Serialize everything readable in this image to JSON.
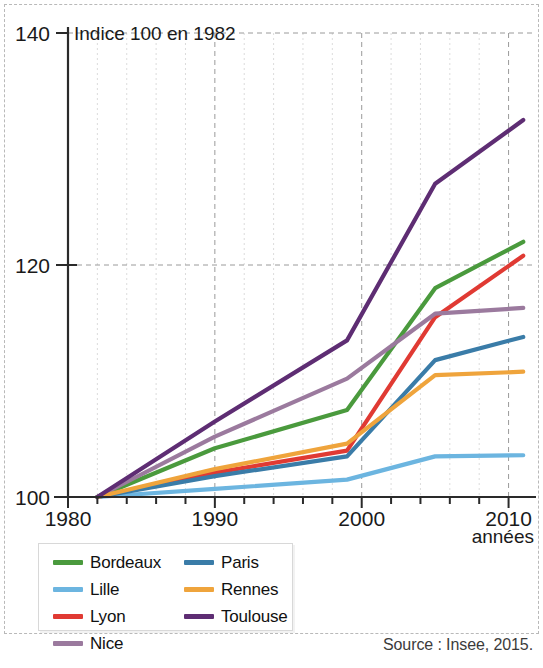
{
  "figure": {
    "plot_note": "Indice 100 en 1982",
    "x_axis_title": "années",
    "source": "Source : Insee, 2015."
  },
  "legend": {
    "items": [
      {
        "label": "Bordeaux",
        "color": "#4a9a3d",
        "column": 1
      },
      {
        "label": "Lille",
        "color": "#6cb5e0",
        "column": 1
      },
      {
        "label": "Lyon",
        "color": "#e03a33",
        "column": 1
      },
      {
        "label": "Nice",
        "color": "#9b7a9e",
        "column": 1
      },
      {
        "label": "Paris",
        "color": "#3a7ca8",
        "column": 2
      },
      {
        "label": "Rennes",
        "color": "#efa43c",
        "column": 2
      },
      {
        "label": "Toulouse",
        "color": "#5e2d73",
        "column": 2
      }
    ]
  },
  "chart_data": {
    "type": "line",
    "title": "",
    "subtitle": "Indice 100 en 1982",
    "xlabel": "années",
    "ylabel": "",
    "xlim": [
      1980,
      2011.8
    ],
    "ylim": [
      100,
      140
    ],
    "x_ticks_major": [
      1980,
      1990,
      2000,
      2010
    ],
    "x_ticks_minor_step": 2,
    "y_ticks": [
      100,
      120,
      140
    ],
    "grid": "dotted vertical every 2 years, dashed major at decades; dashed horizontal at 120 and 140",
    "legend_position": "below-left",
    "x": [
      1982,
      1990,
      1999,
      2005,
      2011
    ],
    "series": [
      {
        "name": "Bordeaux",
        "color": "#4a9a3d",
        "values": [
          100,
          104.2,
          107.5,
          118.0,
          122.0
        ]
      },
      {
        "name": "Lille",
        "color": "#6cb5e0",
        "values": [
          100,
          100.7,
          101.5,
          103.5,
          103.6
        ]
      },
      {
        "name": "Lyon",
        "color": "#e03a33",
        "values": [
          100,
          102.1,
          104.0,
          115.5,
          120.8
        ]
      },
      {
        "name": "Nice",
        "color": "#9b7a9e",
        "values": [
          100,
          105.2,
          110.2,
          115.8,
          116.3
        ]
      },
      {
        "name": "Paris",
        "color": "#3a7ca8",
        "values": [
          100,
          101.8,
          103.5,
          111.8,
          113.8
        ]
      },
      {
        "name": "Rennes",
        "color": "#efa43c",
        "values": [
          100,
          102.4,
          104.6,
          110.5,
          110.8
        ]
      },
      {
        "name": "Toulouse",
        "color": "#5e2d73",
        "values": [
          100,
          106.5,
          113.5,
          127.0,
          132.5
        ]
      }
    ]
  }
}
